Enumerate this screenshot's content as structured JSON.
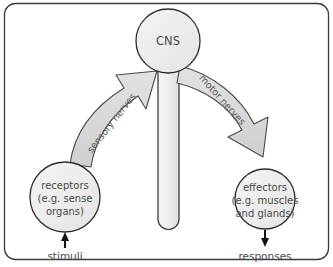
{
  "diagram": {
    "frame": {
      "name": "outer-border",
      "stroke": "#3a3a3a",
      "fill": "#ffffff",
      "radius": 10
    },
    "palette": {
      "shape_fill": "#ededed",
      "shape_stroke": "#2e2e2e",
      "arrow_fill": "#d9d9d9",
      "arrow_stroke": "#4a4a4a",
      "text": "#4a4a4a",
      "nerve_text": "#5a5a5a",
      "io_arrow": "#111111"
    },
    "nodes": {
      "cns": {
        "label": "CNS",
        "shape": "circle",
        "cx": 168,
        "cy": 41,
        "r": 32
      },
      "spinal_cord": {
        "label": "",
        "shape": "rounded-bar",
        "x": 158,
        "y": 60,
        "width": 21,
        "height": 170
      },
      "receptors": {
        "shape": "circle",
        "cx": 65,
        "cy": 197,
        "r": 35,
        "lines": [
          "receptors",
          "(e.g. sense",
          "organs)"
        ]
      },
      "effectors": {
        "shape": "circle",
        "cx": 265,
        "cy": 199,
        "r": 30,
        "lines": [
          "effectors",
          "(e.g. muscles",
          "and glands)"
        ]
      }
    },
    "arrows": {
      "sensory": {
        "label": "sensory nerves",
        "direction": "receptors-to-cns",
        "style": "curved-block-arrow"
      },
      "motor": {
        "label": "motor nerves",
        "direction": "cns-to-effectors",
        "style": "curved-block-arrow"
      },
      "stimuli": {
        "label": "stimuli",
        "direction": "up",
        "target": "receptors"
      },
      "responses": {
        "label": "responses",
        "direction": "down",
        "source": "effectors"
      }
    }
  }
}
